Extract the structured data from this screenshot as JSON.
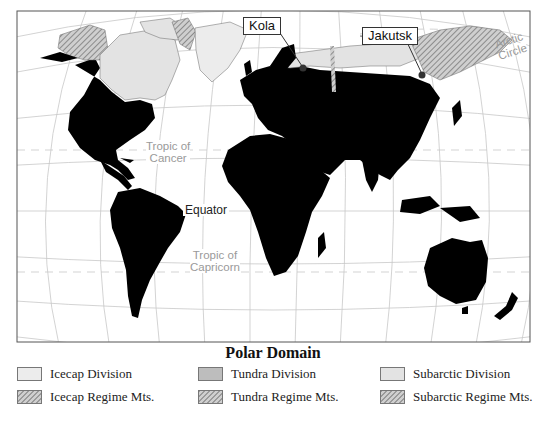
{
  "map": {
    "frame_colors": {
      "land": "#000000",
      "icecap": "#ececec",
      "tundra": "#bdbdbd",
      "subarctic": "#e3e3e3",
      "grid": "#cccccc",
      "frame": "#555555"
    },
    "callouts": [
      {
        "id": "kola",
        "label": "Kola"
      },
      {
        "id": "jakutsk",
        "label": "Jakutsk"
      }
    ],
    "lines": {
      "arctic_circle": "Arctic Circle",
      "arctic_circle_l1": "Arctic",
      "arctic_circle_l2": "Circle",
      "tropic_cancer_l1": "Tropic of",
      "tropic_cancer_l2": "Cancer",
      "equator": "Equator",
      "tropic_capricorn_l1": "Tropic of",
      "tropic_capricorn_l2": "Capricorn"
    }
  },
  "legend": {
    "title": "Polar Domain",
    "items": [
      {
        "label": "Icecap Division",
        "swatch": "icecap"
      },
      {
        "label": "Tundra Division",
        "swatch": "tundra"
      },
      {
        "label": "Subarctic Division",
        "swatch": "subarctic"
      },
      {
        "label": "Icecap Regime Mts.",
        "swatch": "icecap-hatch"
      },
      {
        "label": "Tundra Regime Mts.",
        "swatch": "tundra-hatch"
      },
      {
        "label": "Subarctic Regime Mts.",
        "swatch": "subarctic-hatch"
      }
    ]
  }
}
